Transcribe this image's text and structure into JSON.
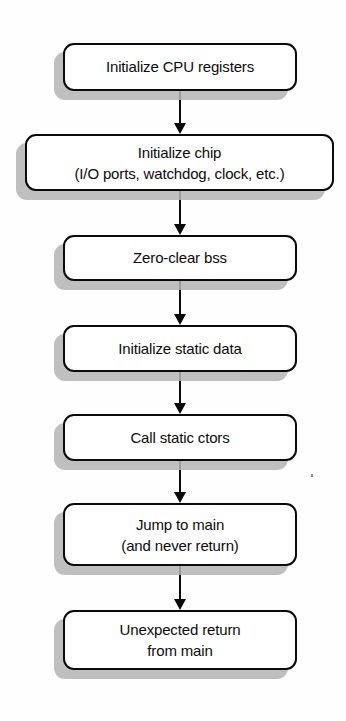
{
  "diagram": {
    "type": "flowchart",
    "orientation": "top-to-bottom",
    "colors": {
      "background": "#fefefe",
      "box_fill": "#ffffff",
      "box_border": "#0a0a0a",
      "box_shadow": "#b5b5b5",
      "text": "#0b0b0b",
      "arrow": "#0a0a0a"
    },
    "nodes": [
      {
        "id": "init-cpu-registers",
        "label": "Initialize CPU registers",
        "lines": [
          "Initialize CPU registers"
        ],
        "shape": "rounded-rectangle",
        "x": 63,
        "y": 43,
        "width": 234,
        "height": 48
      },
      {
        "id": "init-chip",
        "label": "Initialize chip\n(I/O ports, watchdog, clock, etc.)",
        "lines": [
          "Initialize chip",
          "(I/O ports, watchdog, clock, etc.)"
        ],
        "shape": "rounded-rectangle",
        "x": 25,
        "y": 134,
        "width": 309,
        "height": 57
      },
      {
        "id": "zero-clear-bss",
        "label": "Zero-clear bss",
        "lines": [
          "Zero-clear bss"
        ],
        "shape": "rounded-rectangle",
        "x": 63,
        "y": 235,
        "width": 234,
        "height": 46
      },
      {
        "id": "init-static-data",
        "label": "Initialize static data",
        "lines": [
          "Initialize static data"
        ],
        "shape": "rounded-rectangle",
        "x": 63,
        "y": 325,
        "width": 234,
        "height": 47
      },
      {
        "id": "call-static-ctors",
        "label": "Call static ctors",
        "lines": [
          "Call static ctors"
        ],
        "shape": "rounded-rectangle",
        "x": 63,
        "y": 414,
        "width": 234,
        "height": 47
      },
      {
        "id": "jump-to-main",
        "label": "Jump to main\n(and never return)",
        "lines": [
          "Jump to main",
          "(and never return)"
        ],
        "shape": "rounded-rectangle",
        "x": 63,
        "y": 503,
        "width": 234,
        "height": 63
      },
      {
        "id": "unexpected-return",
        "label": "Unexpected return\nfrom main",
        "lines": [
          "Unexpected return",
          "from main"
        ],
        "shape": "rounded-rectangle",
        "x": 63,
        "y": 610,
        "width": 234,
        "height": 60
      }
    ],
    "edges": [
      {
        "id": "edge-1",
        "from": "init-cpu-registers",
        "to": "init-chip",
        "x": 180,
        "y": 91,
        "height": 43,
        "arrowhead": "filled-triangle"
      },
      {
        "id": "edge-2",
        "from": "init-chip",
        "to": "zero-clear-bss",
        "x": 180,
        "y": 191,
        "height": 44,
        "arrowhead": "filled-triangle"
      },
      {
        "id": "edge-3",
        "from": "zero-clear-bss",
        "to": "init-static-data",
        "x": 180,
        "y": 281,
        "height": 44,
        "arrowhead": "filled-triangle"
      },
      {
        "id": "edge-4",
        "from": "init-static-data",
        "to": "call-static-ctors",
        "x": 180,
        "y": 372,
        "height": 42,
        "arrowhead": "filled-triangle"
      },
      {
        "id": "edge-5",
        "from": "call-static-ctors",
        "to": "jump-to-main",
        "x": 180,
        "y": 461,
        "height": 42,
        "arrowhead": "filled-triangle"
      },
      {
        "id": "edge-6",
        "from": "jump-to-main",
        "to": "unexpected-return",
        "x": 180,
        "y": 566,
        "height": 44,
        "arrowhead": "filled-triangle"
      }
    ],
    "artifacts": [
      {
        "id": "scan-speck",
        "x": 311,
        "y": 474
      }
    ]
  }
}
